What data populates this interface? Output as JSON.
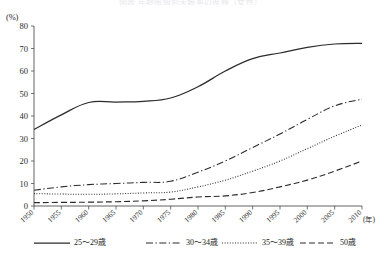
{
  "title": "図表 年齢階級別未婚率の推移（女性）",
  "axes": {
    "y_unit_label": "(%)",
    "x_unit_label": "(年)",
    "y_ticks": [
      "0",
      "10",
      "20",
      "30",
      "40",
      "50",
      "60",
      "70",
      "80"
    ],
    "x_ticks": [
      "1950",
      "1955",
      "1960",
      "1965",
      "1970",
      "1975",
      "1980",
      "1985",
      "1990",
      "1995",
      "2000",
      "2005",
      "2010"
    ]
  },
  "legend": {
    "items": [
      {
        "label": "25～29歳",
        "style": "solid"
      },
      {
        "label": "30～34歳",
        "style": "dashdot"
      },
      {
        "label": "35～39歳",
        "style": "dotted"
      },
      {
        "label": "50歳",
        "style": "dashed"
      }
    ]
  },
  "chart_data": {
    "type": "line",
    "title": "図表 年齢階級別未婚率の推移（女性）",
    "xlabel": "(年)",
    "ylabel": "(%)",
    "xlim": [
      1950,
      2010
    ],
    "ylim": [
      0,
      80
    ],
    "grid": false,
    "legend_position": "bottom",
    "x": [
      1950,
      1955,
      1960,
      1965,
      1970,
      1975,
      1980,
      1985,
      1990,
      1995,
      2000,
      2005,
      2010
    ],
    "series": [
      {
        "name": "25～29歳",
        "style": "solid",
        "values": [
          34.0,
          40.5,
          46.0,
          46.2,
          46.5,
          48.0,
          53.0,
          60.0,
          65.5,
          68.0,
          70.5,
          72.0,
          72.3
        ]
      },
      {
        "name": "30～34歳",
        "style": "dashdot",
        "values": [
          7.0,
          8.5,
          9.5,
          10.0,
          10.5,
          11.0,
          15.0,
          20.0,
          26.0,
          32.0,
          38.5,
          44.5,
          47.5
        ]
      },
      {
        "name": "35～39歳",
        "style": "dotted",
        "values": [
          5.5,
          5.3,
          5.2,
          5.4,
          5.8,
          6.2,
          8.5,
          11.5,
          15.5,
          20.0,
          25.5,
          31.0,
          36.0
        ]
      },
      {
        "name": "50歳",
        "style": "dashed",
        "values": [
          1.5,
          1.6,
          1.7,
          1.9,
          2.3,
          3.0,
          4.0,
          4.5,
          6.0,
          8.5,
          11.5,
          15.5,
          20.0
        ]
      }
    ]
  }
}
